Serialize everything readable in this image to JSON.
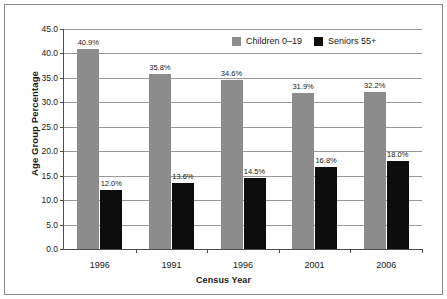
{
  "chart_data": {
    "type": "bar",
    "title": "",
    "xlabel": "Census Year",
    "ylabel": "Age Group Percentage",
    "categories": [
      "1996",
      "1991",
      "1996",
      "2001",
      "2006"
    ],
    "series": [
      {
        "name": "Children 0–19",
        "color": "#8c8c8c",
        "values": [
          40.9,
          35.8,
          34.6,
          31.9,
          32.2
        ],
        "labels": [
          "40.9%",
          "35.8%",
          "34.6%",
          "31.9%",
          "32.2%"
        ]
      },
      {
        "name": "Seniors 55+",
        "color": "#0d0d0d",
        "values": [
          12.0,
          13.6,
          14.5,
          16.8,
          18.0
        ],
        "labels": [
          "12.0%",
          "13.6%",
          "14.5%",
          "16.8%",
          "18.0%"
        ]
      }
    ],
    "ylim": [
      0.0,
      45.0
    ],
    "ytick_values": [
      0.0,
      5.0,
      10.0,
      15.0,
      20.0,
      25.0,
      30.0,
      35.0,
      40.0,
      45.0
    ],
    "ytick_labels": [
      "0.0",
      "5.0",
      "10.0",
      "15.0",
      "20.0",
      "25.0",
      "30.0",
      "35.0",
      "40.0",
      "45.0"
    ],
    "grid": true,
    "legend_position": "top-right"
  },
  "legend": {
    "items": [
      {
        "label": "Children 0–19"
      },
      {
        "label": "Seniors 55+"
      }
    ]
  },
  "axes": {
    "x_title": "Census Year",
    "y_title": "Age Group Percentage"
  }
}
